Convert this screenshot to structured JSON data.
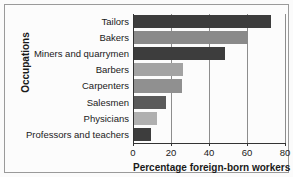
{
  "chart_data": {
    "type": "bar",
    "orientation": "horizontal",
    "title": "",
    "xlabel": "Percentage foreign-born workers",
    "ylabel": "Occupations",
    "categories": [
      "Tailors",
      "Bakers",
      "Miners and quarrymen",
      "Barbers",
      "Carpenters",
      "Salesmen",
      "Physicians",
      "Professors and teachers"
    ],
    "values": [
      72,
      60,
      48,
      26,
      25,
      17,
      12,
      9
    ],
    "xlim": [
      0,
      80
    ],
    "xticks": [
      0,
      20,
      40,
      60,
      80
    ],
    "xtick_labels": [
      "0",
      "20",
      "40",
      "60",
      "80"
    ],
    "grid": "vertical",
    "legend": "none",
    "bar_colors": [
      "#3d3d3d",
      "#8a8a8a",
      "#3d3d3d",
      "#a3a3a3",
      "#909090",
      "#5a5a5a",
      "#b0b0b0",
      "#3d3d3d"
    ],
    "axis_color": "#333333",
    "gridline_color": "#8d8d8d",
    "background_color": "#fcfcfc",
    "frame_color": "#9a9a9a"
  }
}
